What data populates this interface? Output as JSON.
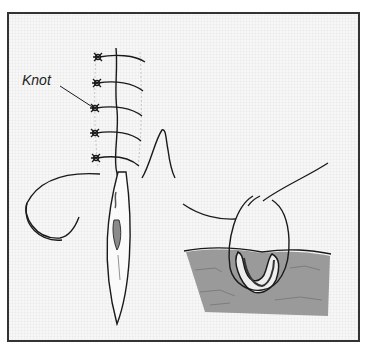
{
  "figure": {
    "labels": {
      "knot": "Knot"
    },
    "colors": {
      "ink": "#1a1a1a",
      "frame_border": "#333333",
      "tissue": "#9a9a9a",
      "wound_fill": "#8a8a8a",
      "background": "#f7f7f7"
    },
    "panels": [
      {
        "name": "sutured-wound",
        "description": "Vertical wound closed with five interrupted sutures, knots on left side"
      },
      {
        "name": "curved-needle",
        "description": "Curved suture needle with thread"
      },
      {
        "name": "open-wound",
        "description": "Open elliptical wound below sutures"
      },
      {
        "name": "cross-section",
        "description": "Cross-section of skin showing suture loop through wound"
      }
    ]
  }
}
